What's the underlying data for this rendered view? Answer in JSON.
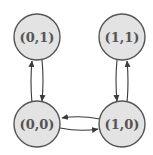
{
  "diagram": {
    "type": "state-transition-graph",
    "colors": {
      "node_fill": "#e3e3e3",
      "node_stroke": "#555555",
      "label": "#555555",
      "edge": "#3a3a3a"
    },
    "nodes": [
      {
        "id": "n01",
        "label": "(0,1)",
        "cx": 37,
        "cy": 37
      },
      {
        "id": "n11",
        "label": "(1,1)",
        "cx": 122,
        "cy": 37
      },
      {
        "id": "n00",
        "label": "(0,0)",
        "cx": 37,
        "cy": 124
      },
      {
        "id": "n10",
        "label": "(1,0)",
        "cx": 122,
        "cy": 124
      }
    ],
    "edges": [
      {
        "from": "(0,0)",
        "to": "(0,1)"
      },
      {
        "from": "(0,1)",
        "to": "(0,0)"
      },
      {
        "from": "(1,1)",
        "to": "(1,0)"
      },
      {
        "from": "(1,0)",
        "to": "(1,1)"
      },
      {
        "from": "(1,0)",
        "to": "(0,0)"
      },
      {
        "from": "(0,0)",
        "to": "(1,0)"
      }
    ]
  }
}
